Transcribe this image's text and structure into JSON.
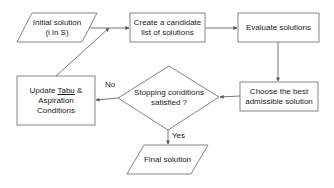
{
  "diagram": {
    "type": "flowchart",
    "colors": {
      "stroke": "#555555",
      "text": "#1a1a1a",
      "background": "#ffffff"
    },
    "nodes": [
      {
        "id": "initial",
        "shape": "parallelogram",
        "line1": "Initial solution",
        "line2": "(i in S)"
      },
      {
        "id": "candidate",
        "shape": "rectangle",
        "line1": "Create a candidate",
        "line2": "list of solutions"
      },
      {
        "id": "evaluate",
        "shape": "rectangle",
        "line1": "Evaluate solutions"
      },
      {
        "id": "choose",
        "shape": "rectangle",
        "line1": "Choose the best",
        "line2": "admissible solution"
      },
      {
        "id": "stopping",
        "shape": "diamond",
        "line1": "Stopping conditions",
        "line2": "satisfied ?"
      },
      {
        "id": "update",
        "shape": "rectangle",
        "line1_pre": "Update ",
        "line1_tabu": "Tabu",
        "line1_post": " &",
        "line2": "Aspiration",
        "line3": "Conditions"
      },
      {
        "id": "final",
        "shape": "parallelogram",
        "line1": "Final solution"
      }
    ],
    "edges": [
      {
        "from": "initial",
        "to": "candidate"
      },
      {
        "from": "candidate",
        "to": "evaluate"
      },
      {
        "from": "evaluate",
        "to": "choose"
      },
      {
        "from": "choose",
        "to": "stopping"
      },
      {
        "from": "stopping",
        "to": "update",
        "label": "No"
      },
      {
        "from": "stopping",
        "to": "final",
        "label": "Yes"
      },
      {
        "from": "update",
        "to": "candidate"
      }
    ],
    "edge_labels": {
      "no": "No",
      "yes": "Yes"
    }
  }
}
